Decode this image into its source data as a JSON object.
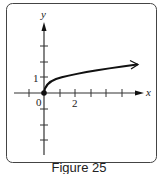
{
  "figure": {
    "caption": "Figure 25",
    "x_axis_label": "x",
    "y_axis_label": "y",
    "origin_label": "0",
    "x_tick_label": "2",
    "y_tick_label": "1",
    "stroke_color": "#111111",
    "curve": {
      "function": "y = sqrt(x)",
      "start": [
        0,
        0
      ],
      "end_arrow": true
    },
    "x_ticks": [
      -1,
      0,
      1,
      2,
      3,
      4,
      5
    ],
    "y_ticks": [
      -4,
      -3,
      -2,
      -1,
      1,
      2,
      3
    ]
  }
}
